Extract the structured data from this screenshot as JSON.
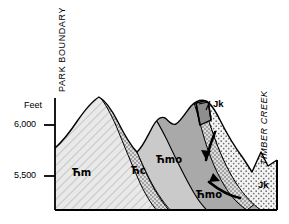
{
  "figure": {
    "type": "geologic-cross-section",
    "background_color": "#ffffff",
    "outline_color": "#000000"
  },
  "axis": {
    "unit_label": "Feet",
    "ticks": [
      {
        "label": "6,000",
        "value": 6000
      },
      {
        "label": "5,500",
        "value": 5500
      }
    ]
  },
  "boundaries": {
    "left_label": "PARK BOUNDARY",
    "right_label": "TIMBER CREEK"
  },
  "units": [
    {
      "symbol": "Ћm",
      "name": "unit-cm",
      "fill": "#e8e8e8",
      "pattern": "diagonal-hatch",
      "label_x": 72,
      "label_y": 168
    },
    {
      "symbol": "Ћc",
      "name": "unit-cc",
      "fill": "#c9c9c9",
      "pattern": "solid",
      "label_x": 131,
      "label_y": 156
    },
    {
      "symbol": "Ћmo",
      "name": "unit-cmo-crest",
      "fill": "#a8a8a8",
      "pattern": "solid",
      "label_x": 156,
      "label_y": 135
    },
    {
      "symbol": "Ћmo",
      "name": "unit-cmo-limb",
      "fill": "#a8a8a8",
      "pattern": "solid",
      "label_x": 196,
      "label_y": 160
    },
    {
      "symbol": "Jk",
      "name": "unit-jk-upper",
      "fill": "#ffffff",
      "pattern": "stipple",
      "label_x": 213,
      "label_y": 105
    },
    {
      "symbol": "Jk",
      "name": "unit-jk-valley",
      "fill": "#ffffff",
      "pattern": "stipple",
      "label_x": 258,
      "label_y": 183
    }
  ],
  "annotations": {
    "fault_arrows": 2,
    "leader_lines": 1,
    "leader_target": "Jk"
  },
  "colors": {
    "hatch_fill": "#e8e8e8",
    "mid_gray": "#c9c9c9",
    "dark_gray": "#a8a8a8",
    "stipple_bg": "#f2f2f2",
    "outline": "#000000",
    "band_fill": "#dedede"
  }
}
